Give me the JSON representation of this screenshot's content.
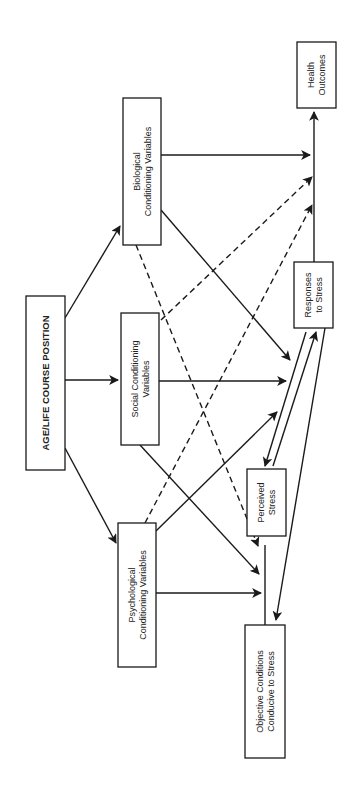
{
  "diagram": {
    "colors": {
      "line": "#1a1a1a",
      "box_fill": "#ffffff",
      "text": "#222222"
    },
    "nodes": [
      {
        "id": "age",
        "lines": [
          "AGE/LIFE COURSE POSITION"
        ],
        "bold": true,
        "x": 26,
        "y": 296,
        "w": 39,
        "h": 174
      },
      {
        "id": "biological",
        "lines": [
          "Biological",
          "Conditioning Variables"
        ],
        "bold": false,
        "x": 123,
        "y": 98,
        "w": 38,
        "h": 147
      },
      {
        "id": "social",
        "lines": [
          "Social Conditioning",
          "Variables"
        ],
        "bold": false,
        "x": 121,
        "y": 313,
        "w": 38,
        "h": 132
      },
      {
        "id": "psychological",
        "lines": [
          "Psychological",
          "Conditioning Variables"
        ],
        "bold": false,
        "x": 118,
        "y": 523,
        "w": 38,
        "h": 144
      },
      {
        "id": "objective",
        "lines": [
          "Objective Conditions",
          "Conducive to Stress"
        ],
        "bold": false,
        "x": 245,
        "y": 625,
        "w": 40,
        "h": 133
      },
      {
        "id": "perceived",
        "lines": [
          "Perceived",
          "Stress"
        ],
        "bold": false,
        "x": 247,
        "y": 469,
        "w": 39,
        "h": 67
      },
      {
        "id": "responses",
        "lines": [
          "Responses",
          "to Stress"
        ],
        "bold": false,
        "x": 294,
        "y": 262,
        "w": 39,
        "h": 66
      },
      {
        "id": "health",
        "lines": [
          "Health",
          "Outcomes"
        ],
        "bold": false,
        "x": 297,
        "y": 42,
        "w": 39,
        "h": 66
      }
    ],
    "edges": [
      {
        "from": "age",
        "to": "biological",
        "style": "solid",
        "arrow": true,
        "x1": 65,
        "y1": 318,
        "x2": 120,
        "y2": 226
      },
      {
        "from": "age",
        "to": "social",
        "style": "solid",
        "arrow": true,
        "x1": 65,
        "y1": 380,
        "x2": 118,
        "y2": 380
      },
      {
        "from": "age",
        "to": "psychological",
        "style": "solid",
        "arrow": true,
        "x1": 65,
        "y1": 448,
        "x2": 116,
        "y2": 543
      },
      {
        "from": "biological",
        "to": "health_path",
        "style": "solid",
        "arrow": true,
        "x1": 161,
        "y1": 155,
        "x2": 310,
        "y2": 155
      },
      {
        "from": "biological",
        "to": "response_path",
        "style": "solid",
        "arrow": true,
        "x1": 161,
        "y1": 210,
        "x2": 290,
        "y2": 360
      },
      {
        "from": "biological",
        "to": "objective_path",
        "style": "dashed",
        "arrow": true,
        "x1": 136,
        "y1": 245,
        "x2": 258,
        "y2": 546
      },
      {
        "from": "social",
        "to": "health_path",
        "style": "dashed",
        "arrow": true,
        "x1": 161,
        "y1": 320,
        "x2": 312,
        "y2": 177
      },
      {
        "from": "social",
        "to": "response_path",
        "style": "solid",
        "arrow": true,
        "x1": 159,
        "y1": 381,
        "x2": 286,
        "y2": 381
      },
      {
        "from": "social",
        "to": "objective_path",
        "style": "solid",
        "arrow": true,
        "x1": 140,
        "y1": 445,
        "x2": 259,
        "y2": 574
      },
      {
        "from": "psychological",
        "to": "health_path",
        "style": "dashed",
        "arrow": true,
        "x1": 145,
        "y1": 523,
        "x2": 312,
        "y2": 205
      },
      {
        "from": "psychological",
        "to": "response_path",
        "style": "solid",
        "arrow": true,
        "x1": 156,
        "y1": 531,
        "x2": 277,
        "y2": 412
      },
      {
        "from": "psychological",
        "to": "objective_path",
        "style": "solid",
        "arrow": true,
        "x1": 156,
        "y1": 593,
        "x2": 261,
        "y2": 593
      },
      {
        "from": "responses",
        "to": "perceived",
        "style": "solid",
        "arrow": true,
        "x1": 306,
        "y1": 332,
        "x2": 265,
        "y2": 466
      },
      {
        "from": "perceived",
        "to": "responses",
        "style": "solid",
        "arrow": true,
        "x1": 273,
        "y1": 466,
        "x2": 316,
        "y2": 332
      },
      {
        "from": "responses",
        "to": "objective",
        "style": "solid",
        "arrow": true,
        "x1": 325,
        "y1": 328,
        "x2": 276,
        "y2": 620
      },
      {
        "from": "responses",
        "to": "health",
        "style": "solid",
        "arrow": true,
        "x1": 314,
        "y1": 262,
        "x2": 314,
        "y2": 112
      },
      {
        "from": "objective",
        "to": "objective_path_line",
        "style": "solid",
        "arrow": false,
        "x1": 265,
        "y1": 625,
        "x2": 265,
        "y2": 545
      }
    ]
  }
}
